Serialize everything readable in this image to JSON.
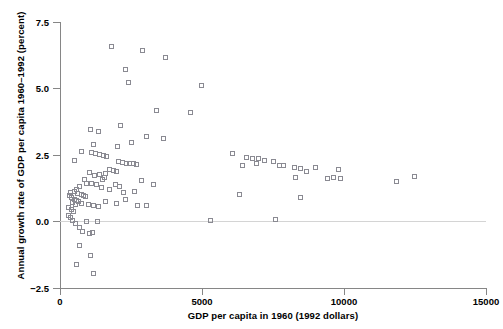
{
  "chart": {
    "title": "",
    "xlabel": "GDP per capita in 1960 (1992 dollars)",
    "ylabel": "Annual growth rate of GDP per capita 1960–1992 (percent)",
    "xticks": [
      "0",
      "5000",
      "10000",
      "15000"
    ],
    "yticks": [
      "7.5",
      "5.0",
      "2.5",
      "0.0",
      "−2.5"
    ],
    "marker": "open-square",
    "marker_color": "#8a8a92",
    "axis_color": "#868686",
    "zero_line_color": "#d4d4d4"
  },
  "chart_data": {
    "type": "scatter",
    "title": "",
    "xlabel": "GDP per capita in 1960 (1992 dollars)",
    "ylabel": "Annual growth rate of GDP per capita 1960–1992 (percent)",
    "xlim": [
      0,
      15000
    ],
    "ylim": [
      -2.5,
      7.5
    ],
    "xticks": [
      0,
      5000,
      10000,
      15000
    ],
    "yticks": [
      -2.5,
      0.0,
      2.5,
      5.0,
      7.5
    ],
    "grid": false,
    "legend": null,
    "annotations": [
      "horizontal reference line at y = 0"
    ],
    "marker_style": "open square",
    "n_points": 112,
    "points": [
      [
        1840,
        6.55
      ],
      [
        2940,
        6.4
      ],
      [
        3720,
        6.15
      ],
      [
        2310,
        5.7
      ],
      [
        2440,
        5.21
      ],
      [
        3400,
        4.18
      ],
      [
        4600,
        4.1
      ],
      [
        2160,
        3.62
      ],
      [
        1080,
        3.45
      ],
      [
        1370,
        3.38
      ],
      [
        3080,
        3.2
      ],
      [
        4990,
        5.1
      ],
      [
        2530,
        2.98
      ],
      [
        3650,
        3.1
      ],
      [
        1180,
        2.9
      ],
      [
        2050,
        2.8
      ],
      [
        790,
        2.62
      ],
      [
        1110,
        2.6
      ],
      [
        1250,
        2.57
      ],
      [
        1420,
        2.52
      ],
      [
        1560,
        2.49
      ],
      [
        1660,
        2.46
      ],
      [
        530,
        2.28
      ],
      [
        2070,
        2.25
      ],
      [
        2210,
        2.22
      ],
      [
        2350,
        2.2
      ],
      [
        2450,
        2.19
      ],
      [
        2590,
        2.17
      ],
      [
        2700,
        2.15
      ],
      [
        6090,
        2.55
      ],
      [
        6600,
        2.4
      ],
      [
        6800,
        2.38
      ],
      [
        7000,
        2.37
      ],
      [
        7210,
        2.31
      ],
      [
        6930,
        2.18
      ],
      [
        6450,
        2.12
      ],
      [
        7520,
        2.26
      ],
      [
        7730,
        2.12
      ],
      [
        7900,
        2.09
      ],
      [
        8260,
        2.04
      ],
      [
        8500,
        2.01
      ],
      [
        8680,
        1.88
      ],
      [
        9020,
        2.05
      ],
      [
        8300,
        1.64
      ],
      [
        9830,
        1.96
      ],
      [
        9440,
        1.61
      ],
      [
        9660,
        1.65
      ],
      [
        9900,
        1.62
      ],
      [
        11860,
        1.52
      ],
      [
        12510,
        1.71
      ],
      [
        5320,
        0.06
      ],
      [
        7620,
        0.08
      ],
      [
        6330,
        1.01
      ],
      [
        8480,
        0.89
      ],
      [
        2900,
        1.53
      ],
      [
        3320,
        1.4
      ],
      [
        1960,
        1.39
      ],
      [
        2100,
        1.33
      ],
      [
        1760,
        1.19
      ],
      [
        2240,
        1.1
      ],
      [
        1600,
        1.65
      ],
      [
        1520,
        1.6
      ],
      [
        1770,
        1.96
      ],
      [
        1900,
        1.92
      ],
      [
        2020,
        1.9
      ],
      [
        1620,
        1.8
      ],
      [
        1400,
        1.76
      ],
      [
        1230,
        1.72
      ],
      [
        1050,
        1.85
      ],
      [
        880,
        1.6
      ],
      [
        950,
        1.45
      ],
      [
        1130,
        1.42
      ],
      [
        1300,
        1.39
      ],
      [
        1470,
        1.3
      ],
      [
        700,
        1.31
      ],
      [
        610,
        1.22
      ],
      [
        520,
        1.14
      ],
      [
        640,
        1.05
      ],
      [
        760,
        1.02
      ],
      [
        830,
        0.98
      ],
      [
        900,
        0.95
      ],
      [
        440,
        0.9
      ],
      [
        530,
        0.85
      ],
      [
        600,
        0.8
      ],
      [
        680,
        0.76
      ],
      [
        760,
        0.7
      ],
      [
        390,
        1.08
      ],
      [
        350,
        0.99
      ],
      [
        470,
        0.72
      ],
      [
        560,
        0.66
      ],
      [
        1020,
        0.66
      ],
      [
        1180,
        0.62
      ],
      [
        1360,
        0.58
      ],
      [
        1620,
        0.76
      ],
      [
        2000,
        0.7
      ],
      [
        2320,
        0.83
      ],
      [
        2630,
        1.12
      ],
      [
        2760,
        0.61
      ],
      [
        3070,
        0.59
      ],
      [
        330,
        0.52
      ],
      [
        420,
        0.45
      ],
      [
        500,
        0.4
      ],
      [
        310,
        0.22
      ],
      [
        380,
        0.15
      ],
      [
        460,
        0.05
      ],
      [
        580,
        -0.06
      ],
      [
        690,
        -0.22
      ],
      [
        820,
        -0.35
      ],
      [
        950,
        0.02
      ],
      [
        1340,
        0.0
      ],
      [
        1160,
        -0.4
      ],
      [
        1060,
        -0.45
      ],
      [
        700,
        -0.9
      ],
      [
        600,
        -1.6
      ],
      [
        1100,
        -1.28
      ],
      [
        1180,
        -1.92
      ]
    ]
  }
}
